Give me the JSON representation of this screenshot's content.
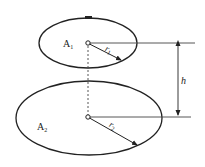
{
  "diagram": {
    "type": "geometry",
    "colors": {
      "stroke": "#222222",
      "background": "#ffffff"
    },
    "top_surface": {
      "label": "A",
      "label_sub": "1",
      "radius_label": "r",
      "radius_sub": "1"
    },
    "bottom_surface": {
      "label": "A",
      "label_sub": "2",
      "radius_label": "r",
      "radius_sub": "2"
    },
    "dimension": {
      "label": "h"
    }
  }
}
